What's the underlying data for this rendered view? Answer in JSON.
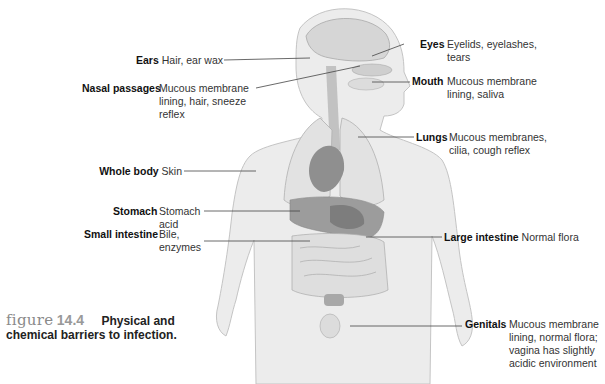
{
  "figure": {
    "word": "figure",
    "number": "14.4",
    "caption_line1": "Physical and",
    "caption_line2": "chemical barriers to infection."
  },
  "labels": [
    {
      "id": "ears",
      "region": "Ears",
      "desc": [
        "Hair, ear wax"
      ]
    },
    {
      "id": "nasal",
      "region": "Nasal passages",
      "desc": [
        "Mucous membrane",
        "lining, hair, sneeze",
        "reflex"
      ]
    },
    {
      "id": "whole",
      "region": "Whole body",
      "desc": [
        "Skin"
      ]
    },
    {
      "id": "stomach",
      "region": "Stomach",
      "desc": [
        "Stomach",
        "acid"
      ]
    },
    {
      "id": "small",
      "region": "Small intestine",
      "desc": [
        "Bile,",
        "enzymes"
      ]
    },
    {
      "id": "eyes",
      "region": "Eyes",
      "desc": [
        "Eyelids, eyelashes,",
        "tears"
      ]
    },
    {
      "id": "mouth",
      "region": "Mouth",
      "desc": [
        "Mucous membrane",
        "lining, saliva"
      ]
    },
    {
      "id": "lungs",
      "region": "Lungs",
      "desc": [
        "Mucous membranes,",
        "cilia, cough reflex"
      ]
    },
    {
      "id": "large",
      "region": "Large intestine",
      "desc": [
        "Normal flora"
      ]
    },
    {
      "id": "genitals",
      "region": "Genitals",
      "desc": [
        "Mucous membrane",
        "lining, normal flora;",
        "vagina has slightly",
        "acidic environment"
      ]
    }
  ],
  "colors": {
    "skin": "#ececec",
    "outline": "#b8b8b8",
    "organ_dark": "#8f8f8f",
    "organ_mid": "#b5b5b5",
    "leader": "#444444"
  }
}
